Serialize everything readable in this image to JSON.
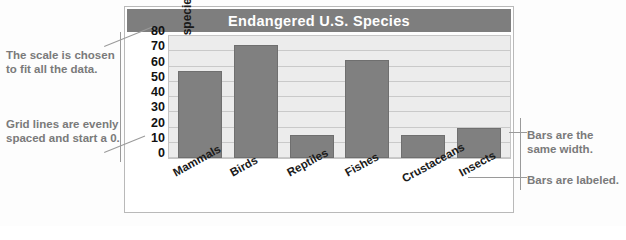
{
  "chart_data": {
    "type": "bar",
    "title": "Endangered U.S. Species",
    "xlabel": "",
    "ylabel": "Number of species",
    "categories": [
      "Mammals",
      "Birds",
      "Reptiles",
      "Fishes",
      "Crustaceans",
      "Insects"
    ],
    "values": [
      57,
      74,
      15,
      64,
      15,
      20
    ],
    "ylim": [
      0,
      80
    ],
    "yticks": [
      0,
      10,
      20,
      30,
      40,
      50,
      60,
      70,
      80
    ],
    "ytick_labels": [
      "0",
      "10",
      "20",
      "30",
      "40",
      "50",
      "60",
      "70",
      "80"
    ],
    "grid": true,
    "legend": "none",
    "bar_color": "#808080",
    "plot_background": "#ececec",
    "gridline_color": "#c9c9c9",
    "title_bar_color": "#7e7e7e",
    "title_text_color": "#ffffff"
  },
  "annotations": {
    "scale": "The scale is chosen to fit all the data.",
    "grid": "Grid lines are evenly spaced and start a 0.",
    "bar_width": "Bars are the same width.",
    "bar_labels": "Bars are labeled."
  }
}
